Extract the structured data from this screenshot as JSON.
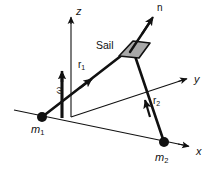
{
  "figure": {
    "background_color": "#ffffff",
    "line_color": "#111111",
    "sail_fill_color": "#a8a8a8",
    "sail_stroke_color": "#111111",
    "axes": [
      {
        "name": "z-axis",
        "label": "z",
        "label_x": 76,
        "label_y": 6
      },
      {
        "name": "y-axis",
        "label": "y",
        "label_x": 194,
        "label_y": 78
      },
      {
        "name": "x-axis",
        "label": "x",
        "label_x": 196,
        "label_y": 150
      }
    ],
    "vectors": [
      {
        "name": "normal",
        "label": "n",
        "label_x": 157,
        "label_y": 4
      },
      {
        "name": "angular-velocity",
        "label": "ω",
        "label_x": 52,
        "label_y": 86
      },
      {
        "name": "r1",
        "label": "r",
        "sub": "1",
        "label_x": 79,
        "label_y": 63
      },
      {
        "name": "r2",
        "label": "r",
        "sub": "2",
        "label_x": 154,
        "label_y": 99
      }
    ],
    "bodies": [
      {
        "name": "mass-1",
        "label": "m",
        "sub": "1",
        "label_x": 31,
        "label_y": 127,
        "dot_x": 42,
        "dot_y": 117,
        "dot_r": 5
      },
      {
        "name": "mass-2",
        "label": "m",
        "sub": "2",
        "label_x": 156,
        "label_y": 155,
        "dot_x": 164,
        "dot_y": 142,
        "dot_r": 5
      }
    ],
    "sail": {
      "label": "Sail",
      "label_x": 96,
      "label_y": 42,
      "polygon": "119,56 133,41 150,43 139,58"
    }
  }
}
